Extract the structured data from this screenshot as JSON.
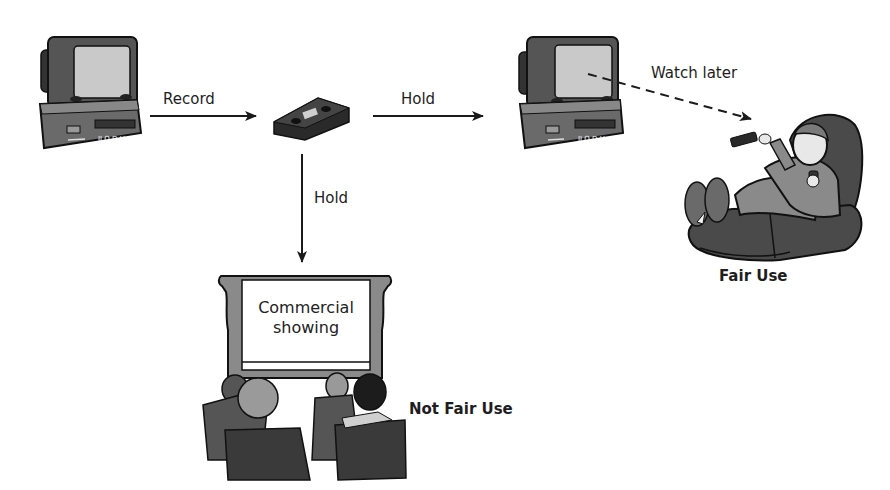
{
  "diagram": {
    "title": "",
    "nodes": {
      "source_tv": {
        "icon": "tv-vcr-icon"
      },
      "tape": {
        "icon": "videotape-icon"
      },
      "home_tv": {
        "icon": "tv-vcr-icon"
      },
      "viewer": {
        "icon": "person-in-recliner-icon"
      },
      "theater": {
        "icon": "movie-theater-icon",
        "screen_text": [
          "Commercial",
          "showing"
        ]
      }
    },
    "edges": {
      "record": {
        "label": "Record",
        "from": "source_tv",
        "to": "tape",
        "style": "solid"
      },
      "hold_right": {
        "label": "Hold",
        "from": "tape",
        "to": "home_tv",
        "style": "solid"
      },
      "hold_down": {
        "label": "Hold",
        "from": "tape",
        "to": "theater",
        "style": "solid"
      },
      "watch_later": {
        "label": "Watch later",
        "from": "home_tv",
        "to": "viewer",
        "style": "dashed"
      }
    },
    "outcomes": {
      "fair_use": "Fair Use",
      "not_fair_use": "Not Fair Use"
    },
    "colors": {
      "ink": "#1a1a1a",
      "dark_gray": "#3c3c3c",
      "mid_gray": "#6e6e6e",
      "light_gray": "#9a9a9a",
      "screen": "#c8c8c8",
      "background": "#ffffff"
    }
  }
}
